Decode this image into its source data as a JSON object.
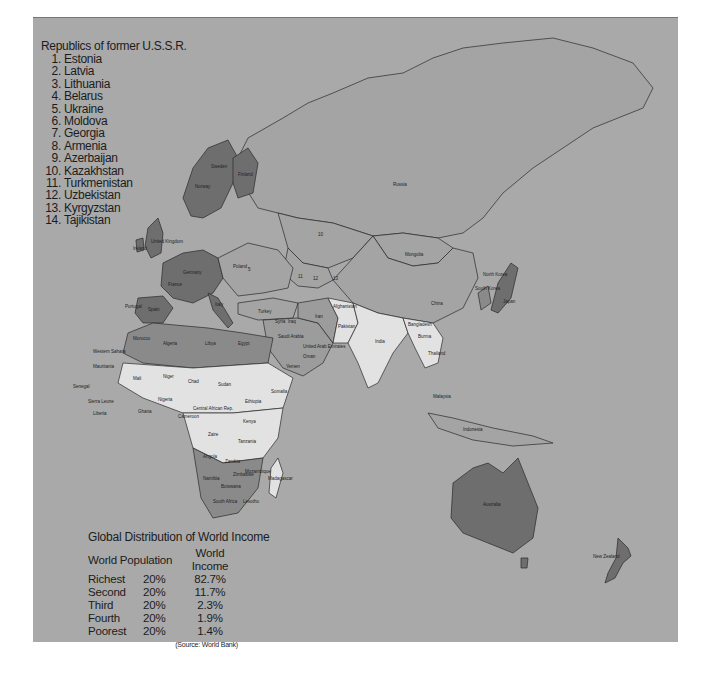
{
  "legend": {
    "title": "Republics of former U.S.S.R.",
    "items": [
      {
        "num": "1.",
        "name": "Estonia"
      },
      {
        "num": "2.",
        "name": "Latvia"
      },
      {
        "num": "3.",
        "name": "Lithuania"
      },
      {
        "num": "4.",
        "name": "Belarus"
      },
      {
        "num": "5.",
        "name": "Ukraine"
      },
      {
        "num": "6.",
        "name": "Moldova"
      },
      {
        "num": "7.",
        "name": "Georgia"
      },
      {
        "num": "8.",
        "name": "Armenia"
      },
      {
        "num": "9.",
        "name": "Azerbaijan"
      },
      {
        "num": "10.",
        "name": "Kazakhstan"
      },
      {
        "num": "11.",
        "name": "Turkmenistan"
      },
      {
        "num": "12.",
        "name": "Uzbekistan"
      },
      {
        "num": "13.",
        "name": "Kyrgyzstan"
      },
      {
        "num": "14.",
        "name": "Tajikistan"
      }
    ]
  },
  "income_table": {
    "title": "Global Distribution of World Income",
    "headers": {
      "population": "World Population",
      "income": "World Income"
    },
    "rows": [
      {
        "group": "Richest",
        "share": "20%",
        "income": "82.7%"
      },
      {
        "group": "Second",
        "share": "20%",
        "income": "11.7%"
      },
      {
        "group": "Third",
        "share": "20%",
        "income": "2.3%"
      },
      {
        "group": "Fourth",
        "share": "20%",
        "income": "1.9%"
      },
      {
        "group": "Poorest",
        "share": "20%",
        "income": "1.4%"
      }
    ],
    "source": "(Source: World Bank)"
  },
  "map": {
    "labels": {
      "russia": "Russia",
      "mongolia": "Mongolia",
      "china": "China",
      "india": "India",
      "japan": "Japan",
      "north_korea": "North Korea",
      "south_korea": "South Korea",
      "iran": "Iran",
      "afghanistan": "Afghanistan",
      "pakistan": "Pakistan",
      "turkey": "Turkey",
      "saudi_arabia": "Saudi Arabia",
      "uae": "United Arab Emirates",
      "oman": "Oman",
      "yemen": "Yemen",
      "iraq": "Iraq",
      "syria": "Syria",
      "poland": "Poland",
      "germany": "Germany",
      "france": "France",
      "spain": "Spain",
      "portugal": "Portugal",
      "italy": "Italy",
      "uk": "United Kingdom",
      "ireland": "Ireland",
      "norway": "Norway",
      "sweden": "Sweden",
      "finland": "Finland",
      "morocco": "Morocco",
      "algeria": "Algeria",
      "libya": "Libya",
      "egypt": "Egypt",
      "western_sahara": "Western Sahara",
      "mauritania": "Mauritania",
      "mali": "Mali",
      "niger": "Niger",
      "chad": "Chad",
      "sudan": "Sudan",
      "ethiopia": "Ethiopia",
      "somalia": "Somalia",
      "senegal": "Senegal",
      "nigeria": "Nigeria",
      "ghana": "Ghana",
      "liberia": "Liberia",
      "sierra_leone": "Sierra Leone",
      "car": "Central African Rep.",
      "cameroon": "Cameroon",
      "zaire": "Zaire",
      "kenya": "Kenya",
      "tanzania": "Tanzania",
      "angola": "Angola",
      "zambia": "Zambia",
      "mozambique": "Mozambique",
      "namibia": "Namibia",
      "botswana": "Botswana",
      "zimbabwe": "Zimbabwe",
      "south_africa": "South Africa",
      "lesotho": "Lesotho",
      "madagascar": "Madagascar",
      "burma": "Burma",
      "thailand": "Thailand",
      "bangladesh": "Bangladesh",
      "malaysia": "Malaysia",
      "indonesia": "Indonesia",
      "australia": "Australia",
      "new_zealand": "New Zealand",
      "n10": "10",
      "n11": "11",
      "n12": "12",
      "n13": "13",
      "n5": "5"
    },
    "colors": {
      "ocean": "#a9a9a9",
      "richest": "#6e6e6e",
      "second": "#8a8a8a",
      "third": "#9c9c9c",
      "poorest": "#e2e2e2",
      "border": "#2a2a2a"
    }
  }
}
